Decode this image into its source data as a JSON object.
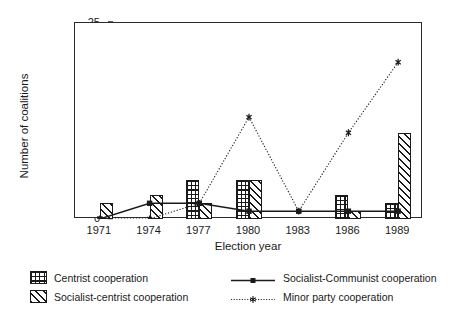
{
  "chart_data": {
    "type": "bar",
    "title": "",
    "xlabel": "Election year",
    "ylabel": "Number of coalitions",
    "categories": [
      "1971",
      "1974",
      "1977",
      "1980",
      "1983",
      "1986",
      "1989"
    ],
    "ylim": [
      0,
      25
    ],
    "yticks": [
      0,
      5,
      10,
      15,
      20,
      25
    ],
    "grid": false,
    "legend_position": "below-plot",
    "series": [
      {
        "name": "Centrist cooperation",
        "kind": "bar",
        "fill": "grid-hatch",
        "values": [
          0,
          0,
          5,
          5,
          0,
          3,
          2
        ]
      },
      {
        "name": "Socialist-centrist cooperation",
        "kind": "bar",
        "fill": "diagonal-hatch",
        "values": [
          2,
          3,
          2,
          5,
          0,
          1,
          11
        ]
      },
      {
        "name": "Socialist-Communist cooperation",
        "kind": "line",
        "style": "solid",
        "marker": "square",
        "values": [
          0,
          2,
          2,
          1,
          1,
          1,
          1
        ]
      },
      {
        "name": "Minor party cooperation",
        "kind": "line",
        "style": "dotted",
        "marker": "star",
        "values": [
          0,
          0,
          2,
          13,
          1,
          11,
          20
        ]
      }
    ]
  },
  "legend": {
    "items": [
      {
        "label": "Centrist cooperation",
        "swatch": "grid-hatch-swatch"
      },
      {
        "label": "Socialist-Communist cooperation",
        "swatch": "solid-line-swatch"
      },
      {
        "label": "Socialist-centrist cooperation",
        "swatch": "diagonal-hatch-swatch"
      },
      {
        "label": "Minor party cooperation",
        "swatch": "dotted-line-swatch"
      }
    ]
  },
  "colors": {
    "axis": "#2b2b2b",
    "ink": "#1a1a1a",
    "background": "#ffffff"
  }
}
